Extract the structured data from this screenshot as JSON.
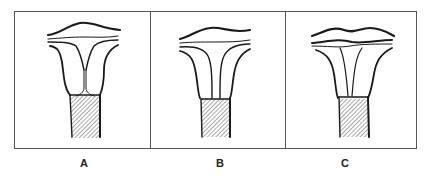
{
  "figure": {
    "panels": [
      {
        "id": "A",
        "label": "A",
        "label_x": 74
      },
      {
        "id": "B",
        "label": "B",
        "label_x": 210
      },
      {
        "id": "C",
        "label": "C",
        "label_x": 335
      }
    ]
  },
  "colors": {
    "ink": "#1a1a1a",
    "border": "#555555",
    "background": "#ffffff"
  }
}
